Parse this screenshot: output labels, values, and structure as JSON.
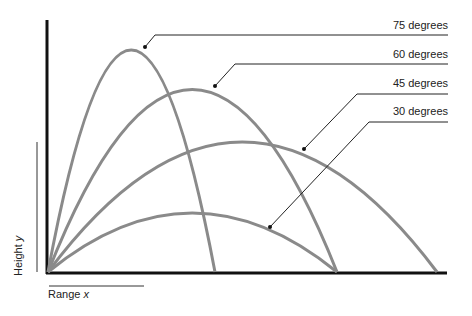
{
  "diagram": {
    "axes": {
      "x_label": "Range",
      "x_var": "x",
      "y_label": "Height",
      "y_var": "y"
    },
    "trajectories": [
      {
        "label": "75 degrees",
        "angle": 75,
        "color": "#8a8a8a"
      },
      {
        "label": "60 degrees",
        "angle": 60,
        "color": "#8a8a8a"
      },
      {
        "label": "45 degrees",
        "angle": 45,
        "color": "#8a8a8a"
      },
      {
        "label": "30 degrees",
        "angle": 30,
        "color": "#8a8a8a"
      }
    ],
    "colors": {
      "axis": "#111111",
      "curve": "#8a8a8a",
      "leader": "#222222"
    }
  }
}
